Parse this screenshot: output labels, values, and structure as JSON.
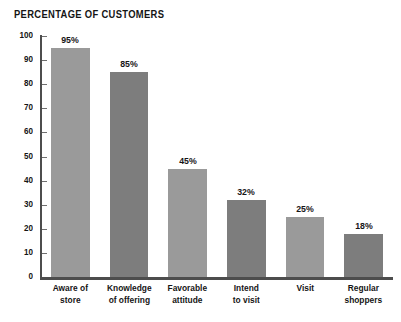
{
  "chart_data": {
    "type": "bar",
    "title": "PERCENTAGE OF CUSTOMERS",
    "xlabel": "",
    "ylabel": "",
    "ylim": [
      0,
      100
    ],
    "yticks": [
      0,
      10,
      20,
      30,
      40,
      50,
      60,
      70,
      80,
      90,
      100
    ],
    "ytick_labels": [
      "0",
      "10",
      "20",
      "30",
      "40",
      "50",
      "60",
      "70",
      "80",
      "90",
      "100"
    ],
    "grid": false,
    "legend": null,
    "categories": [
      "Aware of store",
      "Knowledge of offering",
      "Favorable attitude",
      "Intend to visit",
      "Visit",
      "Regular shoppers"
    ],
    "category_lines": [
      [
        "Aware of",
        "store"
      ],
      [
        "Knowledge",
        "of offering"
      ],
      [
        "Favorable",
        "attitude"
      ],
      [
        "Intend",
        "to visit"
      ],
      [
        "Visit"
      ],
      [
        "Regular",
        "shoppers"
      ]
    ],
    "values": [
      95,
      85,
      45,
      32,
      25,
      18
    ],
    "value_labels": [
      "95%",
      "85%",
      "45%",
      "32%",
      "25%",
      "18%"
    ],
    "bar_colors": [
      "#9a9a9a",
      "#7d7d7d",
      "#9a9a9a",
      "#7d7d7d",
      "#9a9a9a",
      "#7d7d7d"
    ]
  },
  "style": {
    "background": "#ffffff",
    "axis_color": "#4d4d4d",
    "text_color": "#151515",
    "bar_light": "#9a9a9a",
    "bar_dark": "#7d7d7d"
  }
}
